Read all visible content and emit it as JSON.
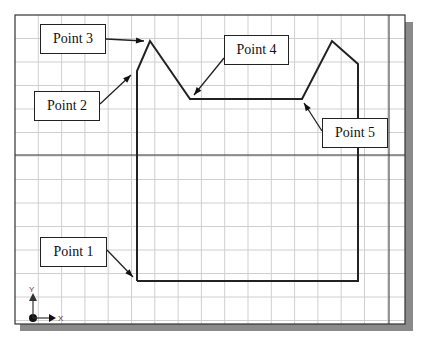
{
  "diagram": {
    "title": "",
    "colors": {
      "background": "#ffffff",
      "grid": "#cfcfcf",
      "frame": "#333333",
      "shadow": "#8a8a8a",
      "outline": "#222222"
    },
    "labels": [
      {
        "id": "point-1",
        "text": "Point 1",
        "box": [
          40,
          237,
          67,
          30
        ],
        "arrow_from": [
          107,
          250
        ],
        "arrow_to": [
          133,
          277
        ]
      },
      {
        "id": "point-2",
        "text": "Point 2",
        "box": [
          34,
          91,
          66,
          30
        ],
        "arrow_from": [
          100,
          104
        ],
        "arrow_to": [
          131,
          75
        ]
      },
      {
        "id": "point-3",
        "text": "Point 3",
        "box": [
          40,
          24,
          66,
          30
        ],
        "arrow_from": [
          106,
          39
        ],
        "arrow_to": [
          144,
          41
        ]
      },
      {
        "id": "point-4",
        "text": "Point 4",
        "box": [
          224,
          35,
          65,
          30
        ],
        "arrow_from": [
          224,
          58
        ],
        "arrow_to": [
          194,
          95
        ]
      },
      {
        "id": "point-5",
        "text": "Point 5",
        "box": [
          322,
          118,
          66,
          30
        ],
        "arrow_from": [
          322,
          131
        ],
        "arrow_to": [
          304,
          103
        ]
      }
    ],
    "shape_points": [
      [
        137,
        281
      ],
      [
        137,
        71
      ],
      [
        150,
        41
      ],
      [
        190,
        99
      ],
      [
        302,
        99
      ],
      [
        332,
        41
      ],
      [
        358,
        64
      ],
      [
        358,
        281
      ],
      [
        137,
        281
      ]
    ],
    "axis_icon": {
      "x_label": "X",
      "y_label": "Y"
    }
  }
}
